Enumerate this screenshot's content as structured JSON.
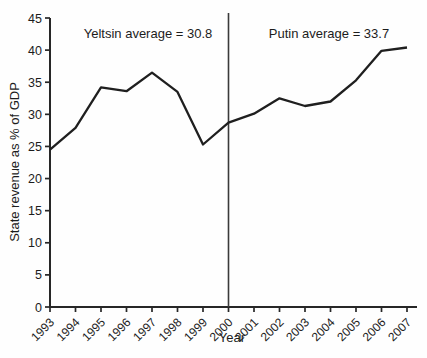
{
  "figure": {
    "background": "#fefefe",
    "colors": {
      "line": "#1f1f1f",
      "axis": "#272727",
      "divider": "#3a3a3a",
      "text": "#1c1c1c"
    }
  },
  "chart_data": {
    "type": "line",
    "title": "",
    "xlabel": "Year",
    "ylabel": "State revenue as % of GDP",
    "x": [
      1993,
      1994,
      1995,
      1996,
      1997,
      1998,
      1999,
      2000,
      2001,
      2002,
      2003,
      2004,
      2005,
      2006,
      2007
    ],
    "series": [
      {
        "name": "State revenue as % of GDP",
        "values": [
          24.5,
          27.9,
          34.2,
          33.6,
          36.5,
          33.5,
          25.3,
          28.7,
          30.1,
          32.5,
          31.3,
          32.0,
          35.3,
          39.9,
          40.4
        ]
      }
    ],
    "ylim": [
      0,
      45
    ],
    "ytick_step": 5,
    "grid": false,
    "legend": "none",
    "divider_year": 2000,
    "annotations": [
      {
        "text": "Yeltsin average = 30.8",
        "anchor_year": 1996.8,
        "y_value": 43
      },
      {
        "text": "Putin average = 33.7",
        "anchor_year": 2004.0,
        "y_value": 43
      }
    ]
  }
}
